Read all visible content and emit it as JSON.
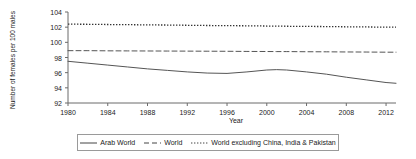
{
  "chart_data": {
    "type": "line",
    "title": "",
    "xlabel": "Year",
    "ylabel": "Number of females per 100 males",
    "xlim": [
      1980,
      2013
    ],
    "ylim": [
      92,
      104
    ],
    "ytick_labels": [
      "104",
      "102",
      "100",
      "98",
      "96",
      "94",
      "92"
    ],
    "ytick_values": [
      104,
      102,
      100,
      98,
      96,
      94,
      92
    ],
    "xtick_labels": [
      "1980",
      "1984",
      "1988",
      "1992",
      "1996",
      "2000",
      "2004",
      "2008",
      "2012"
    ],
    "xtick_values": [
      1980,
      1984,
      1988,
      1992,
      1996,
      2000,
      2004,
      2008,
      2012
    ],
    "grid": false,
    "legend_position": "bottom",
    "x": [
      1980,
      1982,
      1984,
      1986,
      1988,
      1990,
      1992,
      1994,
      1996,
      1998,
      2000,
      2001,
      2002,
      2004,
      2006,
      2008,
      2010,
      2012,
      2013
    ],
    "series": [
      {
        "name": "Arab World",
        "style": "solid",
        "color": "#555555",
        "values": [
          97.5,
          97.25,
          97.0,
          96.75,
          96.5,
          96.3,
          96.1,
          95.95,
          95.9,
          96.1,
          96.35,
          96.4,
          96.35,
          96.1,
          95.8,
          95.4,
          95.05,
          94.7,
          94.6
        ]
      },
      {
        "name": "World",
        "style": "dashed",
        "color": "#555555",
        "values": [
          98.9,
          98.9,
          98.88,
          98.87,
          98.86,
          98.85,
          98.84,
          98.83,
          98.82,
          98.8,
          98.79,
          98.78,
          98.78,
          98.76,
          98.75,
          98.73,
          98.72,
          98.7,
          98.7
        ]
      },
      {
        "name": "World excluding China, India & Pakistan",
        "style": "dotted",
        "color": "#333333",
        "values": [
          102.4,
          102.38,
          102.35,
          102.33,
          102.3,
          102.28,
          102.25,
          102.22,
          102.2,
          102.18,
          102.15,
          102.14,
          102.12,
          102.1,
          102.08,
          102.05,
          102.03,
          102.0,
          102.0
        ]
      }
    ]
  },
  "legend": {
    "items": [
      {
        "label": "Arab World",
        "style": "solid"
      },
      {
        "label": "World",
        "style": "dashed"
      },
      {
        "label": "World excluding China, India & Pakistan",
        "style": "dotted"
      }
    ]
  }
}
